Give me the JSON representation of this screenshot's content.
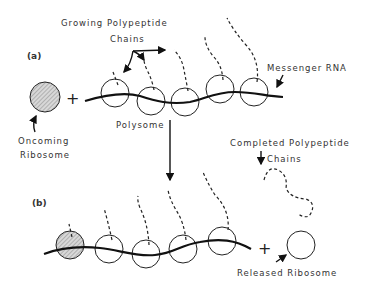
{
  "panel_a": {
    "tag": "(a)",
    "label_growing_line1": "Growing Polypeptide",
    "label_growing_line2": "Chains",
    "label_messenger": "Messenger RNA",
    "label_polysome": "Polysome",
    "label_oncoming_line1": "Oncoming",
    "label_oncoming_line2": "Ribosome",
    "plus": "+"
  },
  "panel_b": {
    "tag": "(b)",
    "label_completed_line1": "Completed Polypeptide",
    "label_completed_line2": "Chains",
    "label_released": "Released  Ribosome",
    "plus": "+"
  },
  "colors": {
    "line": "#111111",
    "hatch": "#9a9a9a",
    "background": "#ffffff"
  }
}
